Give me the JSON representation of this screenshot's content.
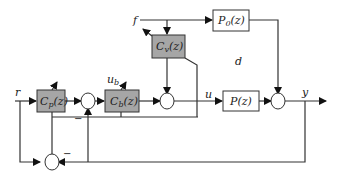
{
  "diagram": {
    "type": "control block diagram",
    "blocks": {
      "cp": {
        "label": "C_p(z)",
        "main": "C",
        "sub": "p",
        "arg": "(z)",
        "fill": "#a6a6a6"
      },
      "cb": {
        "label": "C_b(z)",
        "main": "C",
        "sub": "b",
        "arg": "(z)",
        "fill": "#a6a6a6"
      },
      "cv": {
        "label": "C_v(z)",
        "main": "C",
        "sub": "v",
        "arg": "(z)",
        "fill": "#a6a6a6"
      },
      "p": {
        "label": "P(z)",
        "text": "P(z)",
        "fill": "#ffffff"
      },
      "p0": {
        "label": "P_0(z)",
        "main": "P",
        "sub": "0",
        "arg": "(z)",
        "fill": "#ffffff"
      }
    },
    "signals": {
      "r": "r",
      "f": "f",
      "d": "d",
      "u": "u",
      "y": "y",
      "ub_main": "u",
      "ub_sub": "b"
    },
    "signs": {
      "sum1_minus": "−",
      "sum_bottom_minus": "−"
    },
    "colors": {
      "line": "#333333",
      "controller_fill": "#a6a6a6",
      "plant_fill": "#ffffff"
    }
  }
}
